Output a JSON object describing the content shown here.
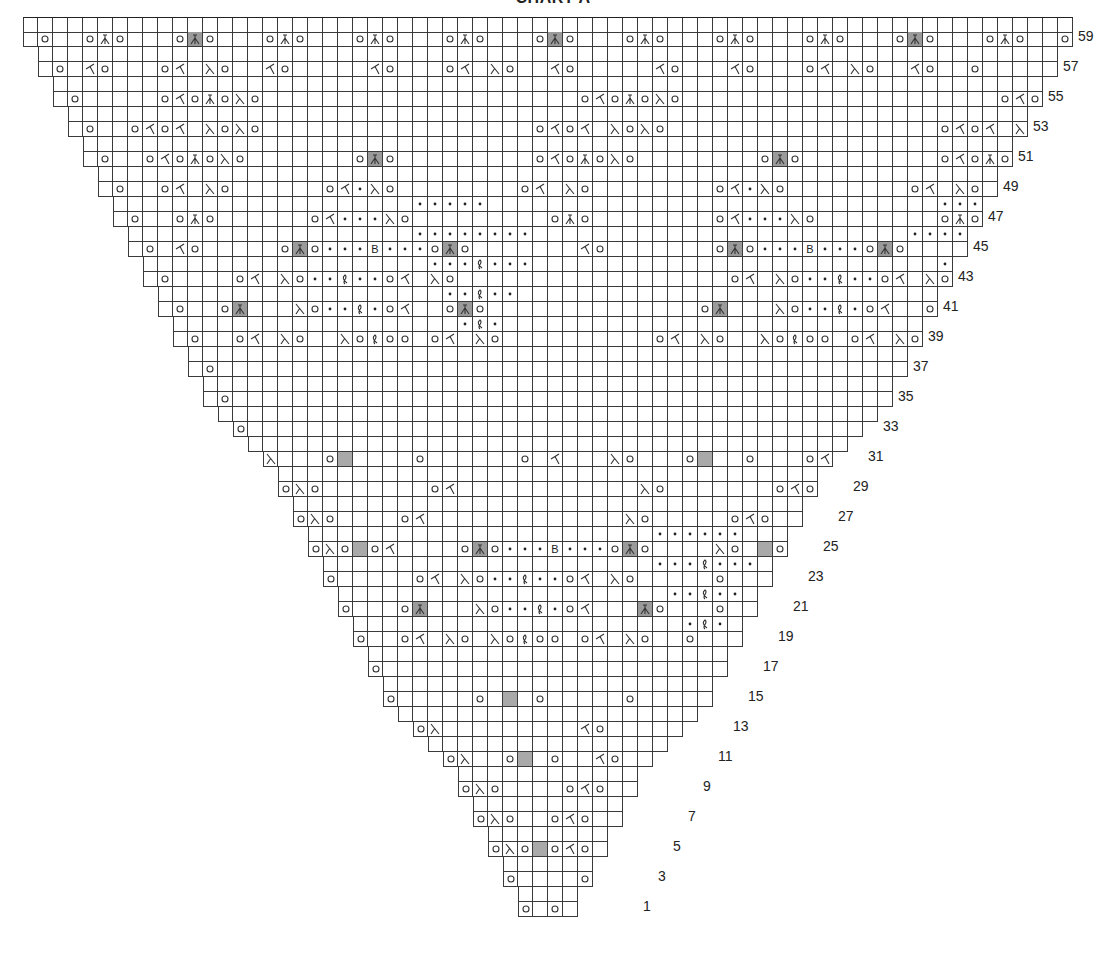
{
  "title": "CHART A",
  "grid": {
    "origin_x": 23,
    "origin_y": 17,
    "cell": 15,
    "total_columns": 70,
    "total_rows": 60
  },
  "legend_symbols": {
    ".": "blank",
    "o": "yarn-over",
    "/": "k2tog",
    "\\": "ssk",
    "^": "double-decrease",
    "A": "double-decrease-gray",
    "G": "no-stitch-gray",
    "p": "purl",
    "t": "twisted-stitch",
    "B": "bobble"
  },
  "row_labels": [
    {
      "label": "59",
      "x": 1078,
      "y": 36
    },
    {
      "label": "57",
      "x": 1063,
      "y": 66
    },
    {
      "label": "55",
      "x": 1048,
      "y": 96
    },
    {
      "label": "53",
      "x": 1033,
      "y": 126
    },
    {
      "label": "51",
      "x": 1018,
      "y": 156
    },
    {
      "label": "49",
      "x": 1003,
      "y": 186
    },
    {
      "label": "47",
      "x": 988,
      "y": 216
    },
    {
      "label": "45",
      "x": 973,
      "y": 246
    },
    {
      "label": "43",
      "x": 958,
      "y": 276
    },
    {
      "label": "41",
      "x": 943,
      "y": 306
    },
    {
      "label": "39",
      "x": 928,
      "y": 336
    },
    {
      "label": "37",
      "x": 913,
      "y": 366
    },
    {
      "label": "35",
      "x": 898,
      "y": 396
    },
    {
      "label": "33",
      "x": 883,
      "y": 426
    },
    {
      "label": "31",
      "x": 868,
      "y": 456
    },
    {
      "label": "29",
      "x": 853,
      "y": 486
    },
    {
      "label": "27",
      "x": 838,
      "y": 516
    },
    {
      "label": "25",
      "x": 823,
      "y": 546
    },
    {
      "label": "23",
      "x": 808,
      "y": 576
    },
    {
      "label": "21",
      "x": 793,
      "y": 606
    },
    {
      "label": "19",
      "x": 778,
      "y": 636
    },
    {
      "label": "17",
      "x": 763,
      "y": 666
    },
    {
      "label": "15",
      "x": 748,
      "y": 696
    },
    {
      "label": "13",
      "x": 733,
      "y": 726
    },
    {
      "label": "11",
      "x": 718,
      "y": 756
    },
    {
      "label": "9",
      "x": 703,
      "y": 786
    },
    {
      "label": "7",
      "x": 688,
      "y": 816
    },
    {
      "label": "5",
      "x": 673,
      "y": 846
    },
    {
      "label": "3",
      "x": 658,
      "y": 876
    },
    {
      "label": "1",
      "x": 643,
      "y": 906
    }
  ],
  "row_left_offsets": {
    "60": 0,
    "59": 0,
    "58": 1,
    "57": 1,
    "56": 2,
    "55": 2,
    "54": 3,
    "53": 3,
    "52": 4,
    "51": 4,
    "50": 5,
    "49": 5,
    "48": 6,
    "47": 6,
    "46": 7,
    "45": 7,
    "44": 8,
    "43": 8,
    "42": 9,
    "41": 9,
    "40": 10,
    "39": 10,
    "38": 11,
    "37": 11,
    "36": 12,
    "35": 12,
    "34": 13,
    "33": 14,
    "32": 15,
    "31": 16,
    "30": 17,
    "29": 17,
    "28": 18,
    "27": 18,
    "26": 19,
    "25": 19,
    "24": 20,
    "23": 20,
    "22": 21,
    "21": 21,
    "20": 22,
    "19": 22,
    "18": 23,
    "17": 23,
    "16": 24,
    "15": 24,
    "14": 25,
    "13": 26,
    "12": 27,
    "11": 28,
    "10": 29,
    "9": 29,
    "8": 30,
    "7": 30,
    "6": 31,
    "5": 31,
    "4": 32,
    "3": 32,
    "2": 33,
    "1": 33
  },
  "rows": {
    "59": ".o..o^o...oAo...o^o...o^o...o^o...oAo...o^o...o^o...o^o...oAo...o^o..o",
    "57": "..o./o...o/.\\o../o...../o...o/.\\o../o...../o.../o...o/.\\o../o..o.",
    "55": "...o.....o/o^o\\o.....................o/o^o\\o.....................o/o^o\\o...o..",
    "53": "....o..o/o/.\\o\\o..................o/o/.\\o\\o..................o/o/.\\o\\o....o...",
    "51": ".....o..o/o^o\\o.......oAo.........o/o^o\\o........oAo.........o/o^o\\o....o....",
    "49": "......o..o/.\\o......o/p\\o........o/.\\o........o/p\\o........o/.\\o...o.....",
    "47": ".......o..o^o......o/ppp\\o.........o^o........o/ppp\\o........o^o...o......",
    "45": "........o./o.....oAopppBpppoAo......./o.......oAopppBpppoAo....../o...o.......",
    "43": ".........o....o/.\\opptppo/.\\o..................o/.\\opptppo/.\\o......o........",
    "41": "..........o..oA...\\opptpo/..oAo..............oA...\\opptpo/..oAo....o.........",
    "39": "...........o..o/.\\o..\\otoo.o/.\\o..........o/.\\o..\\otoo.o/.\\o..o..........",
    "37": "............o..........................................................o...........",
    "35": ".............o..........................................................o............",
    "33": "..............o.......................................................o.............",
    "31": "...............o\\...oG....o......o./...\\o...oG..o...o/o...............",
    "29": ".................o\\o.......o/............\\o.......o/o.................",
    "27": "..................o\\o....o/.............\\o.....o/o..................",
    "25": "...................o\\oGo/....oAopppBpppoAo....\\o.Go/o...................",
    "23": "....................o.....o/.\\opptppo/.\\o.....o....................",
    "21": ".....................o...oA...\\opptpo/...Ao...o.....................",
    "19": "......................o..o/.\\o.\\otoo.o/.\\o..o......................",
    "17": ".......................o...........................o.......................",
    "15": "........................o.....o.G.o.....o........................",
    "13": "..........................o\\........./o..........................",
    "11": "............................o\\..oG.o../o............................",
    "9": ".............................o\\o....o/o.............................",
    "7": "..............................o\\o..o/o..............................",
    "5": "...............................o\\oGo/o...............................",
    "3": "................................o....o................................",
    "1": ".................................o.o.................................",
    "48": "..........................ppppp..............................ppppp..........................",
    "46": "..........................pppppppp.........................pppppppp........................",
    "44": "...........................ppptppp...........................ppptppp.........................",
    "42": "............................pptpp.............................pptpp..........................",
    "40": ".............................ptp...............................ptp...........................",
    "26": "..........................................pppppp.........................",
    "24": "..........................................ppptppp........................",
    "22": "...........................................pptpp.........................",
    "20": "............................................ptp.........................."
  }
}
